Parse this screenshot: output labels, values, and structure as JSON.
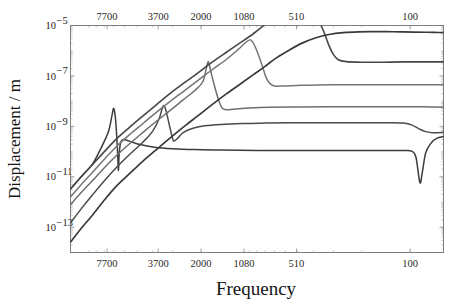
{
  "chart_data": {
    "type": "line",
    "title": "",
    "xlabel": "Frequency",
    "ylabel": "Displacement / m",
    "xscale": "log-reversed",
    "yscale": "log",
    "grid": false,
    "legend": "none",
    "xlim": [
      13000,
      62
    ],
    "ylim": [
      1e-14,
      1e-05
    ],
    "x_tick_labels_top": [
      "7700",
      "3700",
      "2000",
      "1080",
      "510",
      "100"
    ],
    "x_tick_labels_bottom": [
      "7700",
      "3700",
      "2000",
      "1080",
      "510",
      "100"
    ],
    "x_tick_values": [
      7700,
      3700,
      2000,
      1080,
      510,
      100
    ],
    "y_tick_labels": [
      "10−5",
      "10−7",
      "10−9",
      "10−11",
      "10−13"
    ],
    "y_tick_values": [
      1e-05,
      1e-07,
      1e-09,
      1e-11,
      1e-13
    ],
    "y_tick_mantissa": [
      "10",
      "10",
      "10",
      "10",
      "10"
    ],
    "y_tick_exponent": [
      "-5",
      "-7",
      "-9",
      "-11",
      "-13"
    ],
    "series": [
      {
        "name": "mode-1",
        "color": "#3c3c3c",
        "width": 1.5,
        "resonance_hz": 7000,
        "plateau_value": 3e-10,
        "points": [
          [
            13000,
            3.3e-12
          ],
          [
            11000,
            1.1e-11
          ],
          [
            9500,
            3.2e-11
          ],
          [
            8600,
            1e-10
          ],
          [
            8000,
            2.6e-10
          ],
          [
            7500,
            7e-10
          ],
          [
            7150,
            3e-09
          ],
          [
            7000,
            5.2e-09
          ],
          [
            6850,
            2.6e-09
          ],
          [
            6700,
            4e-10
          ],
          [
            6600,
            6e-11
          ],
          [
            6540,
            1.8e-11
          ],
          [
            6480,
            7e-11
          ],
          [
            6350,
            2.2e-10
          ],
          [
            6100,
            3e-10
          ],
          [
            5600,
            2.6e-10
          ],
          [
            4800,
            1.9e-10
          ],
          [
            3900,
            1.5e-10
          ],
          [
            3000,
            1.3e-10
          ],
          [
            2200,
            1.2e-10
          ],
          [
            1500,
            1.15e-10
          ],
          [
            900,
            1.1e-10
          ],
          [
            500,
            1.1e-10
          ],
          [
            250,
            1.1e-10
          ],
          [
            140,
            1.1e-10
          ],
          [
            110,
            1.1e-10
          ],
          [
            98,
            1.05e-10
          ],
          [
            92,
            6e-11
          ],
          [
            87,
            6e-12
          ],
          [
            84,
            1.5e-11
          ],
          [
            80,
            9e-11
          ],
          [
            74,
            2.2e-10
          ],
          [
            68,
            3.4e-10
          ],
          [
            62,
            4e-10
          ]
        ]
      },
      {
        "name": "mode-2",
        "color": "#4a4a4a",
        "width": 1.5,
        "resonance_hz": 3400,
        "plateau_value": 1.4e-09,
        "points": [
          [
            13000,
            1.5e-13
          ],
          [
            11000,
            6e-13
          ],
          [
            9500,
            1.9e-12
          ],
          [
            8000,
            7e-12
          ],
          [
            6800,
            2.2e-11
          ],
          [
            5600,
            7.5e-11
          ],
          [
            4600,
            2.4e-10
          ],
          [
            4000,
            6.5e-10
          ],
          [
            3650,
            2e-09
          ],
          [
            3480,
            5.6e-09
          ],
          [
            3400,
            6.5e-09
          ],
          [
            3300,
            4e-09
          ],
          [
            3150,
            1.1e-09
          ],
          [
            3020,
            3.6e-10
          ],
          [
            2950,
            2.6e-10
          ],
          [
            2800,
            3.4e-10
          ],
          [
            2600,
            5.5e-10
          ],
          [
            2300,
            8e-10
          ],
          [
            1900,
            1.05e-09
          ],
          [
            1500,
            1.2e-09
          ],
          [
            1100,
            1.3e-09
          ],
          [
            800,
            1.35e-09
          ],
          [
            500,
            1.4e-09
          ],
          [
            300,
            1.4e-09
          ],
          [
            180,
            1.4e-09
          ],
          [
            130,
            1.4e-09
          ],
          [
            110,
            1.35e-09
          ],
          [
            98,
            1.15e-09
          ],
          [
            88,
            8e-10
          ],
          [
            80,
            6.2e-10
          ],
          [
            72,
            5.6e-10
          ],
          [
            62,
            5.8e-10
          ]
        ]
      },
      {
        "name": "mode-3",
        "color": "#6e6e6e",
        "width": 1.5,
        "resonance_hz": 1800,
        "plateau_value": 6e-09,
        "points": [
          [
            13000,
            8e-13
          ],
          [
            11000,
            2.6e-12
          ],
          [
            9500,
            7e-12
          ],
          [
            8000,
            2.3e-11
          ],
          [
            6800,
            6.5e-11
          ],
          [
            5600,
            2e-10
          ],
          [
            4600,
            5.8e-10
          ],
          [
            3800,
            1.6e-09
          ],
          [
            3100,
            4.4e-09
          ],
          [
            2600,
            1.1e-08
          ],
          [
            2200,
            2.6e-08
          ],
          [
            1950,
            6e-08
          ],
          [
            1830,
            3e-07
          ],
          [
            1790,
            3.3e-07
          ],
          [
            1720,
            1.1e-07
          ],
          [
            1620,
            2.6e-08
          ],
          [
            1540,
            9e-09
          ],
          [
            1480,
            5.4e-09
          ],
          [
            1400,
            4.6e-09
          ],
          [
            1250,
            4.8e-09
          ],
          [
            1000,
            5.3e-09
          ],
          [
            750,
            5.7e-09
          ],
          [
            500,
            5.9e-09
          ],
          [
            320,
            6e-09
          ],
          [
            200,
            6e-09
          ],
          [
            140,
            6e-09
          ],
          [
            110,
            6e-09
          ],
          [
            90,
            6e-09
          ],
          [
            75,
            5.9e-09
          ],
          [
            62,
            5.8e-09
          ]
        ]
      },
      {
        "name": "mode-4",
        "color": "#767676",
        "width": 1.5,
        "resonance_hz": 960,
        "plateau_value": 4.5e-08,
        "points": [
          [
            13000,
            1.6e-12
          ],
          [
            11000,
            5.5e-12
          ],
          [
            9500,
            1.5e-11
          ],
          [
            8000,
            5e-11
          ],
          [
            6800,
            1.5e-10
          ],
          [
            5600,
            4.6e-10
          ],
          [
            4600,
            1.3e-09
          ],
          [
            3800,
            3.6e-09
          ],
          [
            3100,
            1e-08
          ],
          [
            2500,
            2.8e-08
          ],
          [
            2100,
            6.5e-08
          ],
          [
            1700,
            1.8e-07
          ],
          [
            1400,
            4.4e-07
          ],
          [
            1180,
            1.1e-06
          ],
          [
            1030,
            2.4e-06
          ],
          [
            970,
            2.5e-06
          ],
          [
            910,
            1.2e-06
          ],
          [
            840,
            3e-07
          ],
          [
            790,
            9e-08
          ],
          [
            750,
            5.2e-08
          ],
          [
            700,
            4e-08
          ],
          [
            620,
            4e-08
          ],
          [
            500,
            4.2e-08
          ],
          [
            380,
            4.4e-08
          ],
          [
            260,
            4.5e-08
          ],
          [
            180,
            4.5e-08
          ],
          [
            130,
            4.5e-08
          ],
          [
            100,
            4.5e-08
          ],
          [
            80,
            4.5e-08
          ],
          [
            62,
            4.5e-08
          ]
        ]
      },
      {
        "name": "mode-5",
        "color": "#474747",
        "width": 1.6,
        "resonance_hz": 470,
        "plateau_value": 3.6e-07,
        "points": [
          [
            13000,
            3.3e-12
          ],
          [
            11000,
            1.1e-11
          ],
          [
            9500,
            3e-11
          ],
          [
            8000,
            1e-10
          ],
          [
            6800,
            3e-10
          ],
          [
            5600,
            9e-10
          ],
          [
            4600,
            2.6e-09
          ],
          [
            3800,
            7.2e-09
          ],
          [
            3100,
            2.1e-08
          ],
          [
            2500,
            5.8e-08
          ],
          [
            2100,
            1.3e-07
          ],
          [
            1700,
            3.6e-07
          ],
          [
            1400,
            8.5e-07
          ],
          [
            1150,
            2e-06
          ],
          [
            950,
            4.6e-06
          ],
          [
            800,
            1.1e-05
          ],
          [
            680,
            2.6e-05
          ],
          [
            560,
            6.5e-05
          ],
          [
            490,
            0.00014
          ],
          [
            455,
            0.00015
          ],
          [
            420,
            8e-05
          ],
          [
            380,
            2.2e-05
          ],
          [
            345,
            5.8e-06
          ],
          [
            320,
            1.6e-06
          ],
          [
            300,
            7e-07
          ],
          [
            280,
            4.4e-07
          ],
          [
            250,
            3.7e-07
          ],
          [
            200,
            3.5e-07
          ],
          [
            150,
            3.5e-07
          ],
          [
            110,
            3.6e-07
          ],
          [
            85,
            3.6e-07
          ],
          [
            70,
            3.6e-07
          ],
          [
            62,
            3.6e-07
          ]
        ]
      },
      {
        "name": "mode-6",
        "color": "#3a3a3a",
        "width": 1.7,
        "resonance_hz": 100,
        "plateau_value": 5.5e-06,
        "points": [
          [
            13000,
            2.6e-14
          ],
          [
            11000,
            1e-13
          ],
          [
            9500,
            3e-13
          ],
          [
            8000,
            1.2e-12
          ],
          [
            6800,
            4e-12
          ],
          [
            5600,
            1.3e-11
          ],
          [
            4600,
            4.2e-11
          ],
          [
            3800,
            1.2e-10
          ],
          [
            3100,
            3.6e-10
          ],
          [
            2500,
            1.1e-09
          ],
          [
            2100,
            2.6e-09
          ],
          [
            1700,
            7.5e-09
          ],
          [
            1400,
            1.9e-08
          ],
          [
            1150,
            4.6e-08
          ],
          [
            950,
            1.1e-07
          ],
          [
            800,
            2.4e-07
          ],
          [
            680,
            5.2e-07
          ],
          [
            560,
            1.1e-06
          ],
          [
            470,
            2e-06
          ],
          [
            390,
            3.2e-06
          ],
          [
            320,
            4.4e-06
          ],
          [
            260,
            5.2e-06
          ],
          [
            210,
            5.6e-06
          ],
          [
            170,
            5.7e-06
          ],
          [
            140,
            5.7e-06
          ],
          [
            115,
            5.6e-06
          ],
          [
            95,
            5.5e-06
          ],
          [
            80,
            5.4e-06
          ],
          [
            70,
            5.3e-06
          ],
          [
            62,
            5.2e-06
          ]
        ]
      }
    ]
  },
  "plot": {
    "frame_color": "#7d7d7d",
    "background": "#ffffff"
  }
}
